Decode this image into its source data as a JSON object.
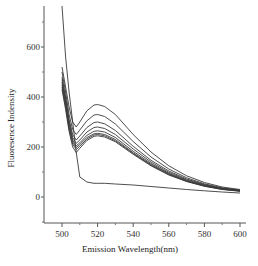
{
  "chart_data": {
    "type": "line",
    "title": "",
    "xlabel": "Emission Wavelength(nm)",
    "ylabel": "Fluoresence Indensity",
    "xlim": [
      490,
      602
    ],
    "ylim": [
      -100,
      780
    ],
    "xticks": [
      500,
      520,
      540,
      560,
      580,
      600
    ],
    "yticks": [
      0,
      200,
      400,
      600
    ],
    "grid": false,
    "legend": "none",
    "x": [
      500,
      502,
      504,
      506,
      508,
      510,
      514,
      518,
      520,
      524,
      530,
      540,
      550,
      560,
      570,
      580,
      590,
      600
    ],
    "series": [
      {
        "name": "curve 1",
        "values": [
          780,
          560,
          420,
          300,
          180,
          80,
          60,
          55,
          55,
          55,
          52,
          48,
          42,
          36,
          30,
          25,
          20,
          16
        ]
      },
      {
        "name": "curve 2",
        "values": [
          520,
          440,
          360,
          300,
          280,
          300,
          345,
          368,
          370,
          362,
          330,
          250,
          180,
          125,
          85,
          58,
          40,
          30
        ]
      },
      {
        "name": "curve 3",
        "values": [
          500,
          420,
          330,
          270,
          250,
          268,
          305,
          328,
          330,
          322,
          292,
          222,
          160,
          112,
          77,
          53,
          37,
          28
        ]
      },
      {
        "name": "curve 4",
        "values": [
          480,
          400,
          310,
          250,
          228,
          244,
          278,
          298,
          300,
          293,
          266,
          203,
          147,
          104,
          72,
          50,
          35,
          27
        ]
      },
      {
        "name": "curve 5",
        "values": [
          470,
          390,
          300,
          238,
          215,
          228,
          260,
          278,
          280,
          274,
          250,
          192,
          140,
          99,
          69,
          48,
          34,
          26
        ]
      },
      {
        "name": "curve 6",
        "values": [
          460,
          380,
          290,
          228,
          205,
          217,
          247,
          263,
          265,
          260,
          238,
          183,
          134,
          95,
          66,
          46,
          33,
          25
        ]
      },
      {
        "name": "curve 7",
        "values": [
          450,
          370,
          280,
          220,
          198,
          210,
          238,
          253,
          255,
          250,
          230,
          177,
          130,
          92,
          64,
          45,
          32,
          24
        ]
      },
      {
        "name": "curve 8",
        "values": [
          440,
          360,
          272,
          212,
          190,
          203,
          232,
          248,
          250,
          245,
          225,
          174,
          127,
          90,
          63,
          44,
          31,
          24
        ]
      },
      {
        "name": "curve 9",
        "values": [
          430,
          350,
          262,
          200,
          178,
          195,
          226,
          243,
          245,
          240,
          221,
          171,
          125,
          88,
          62,
          43,
          30,
          23
        ]
      }
    ]
  },
  "axes": {
    "x_title": "Emission Wavelength(nm)",
    "y_title": "Fluoresence Indensity",
    "x_tick_labels": [
      "500",
      "520",
      "540",
      "560",
      "580",
      "600"
    ],
    "y_tick_labels": [
      "0",
      "200",
      "400",
      "600"
    ]
  },
  "colors": {
    "line": "#3a3a3a",
    "axis": "#555555",
    "background": "#ffffff"
  }
}
